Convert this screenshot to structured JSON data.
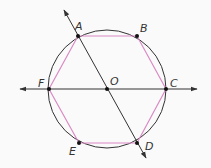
{
  "diagram": {
    "type": "inscribed-regular-hexagon",
    "circle": {
      "center": "O",
      "cx": 107,
      "cy": 89,
      "r": 59,
      "stroke": "#333333"
    },
    "hexagon": {
      "vertices": [
        "A",
        "B",
        "C",
        "D",
        "E",
        "F"
      ],
      "stroke": "#d98ac4"
    },
    "points": [
      {
        "id": "A",
        "label": "A",
        "x": 78,
        "y": 36,
        "lx": 75,
        "ly": 30
      },
      {
        "id": "B",
        "label": "B",
        "x": 137,
        "y": 36,
        "lx": 140,
        "ly": 32
      },
      {
        "id": "C",
        "label": "C",
        "x": 166,
        "y": 89,
        "lx": 170,
        "ly": 87
      },
      {
        "id": "D",
        "label": "D",
        "x": 137,
        "y": 143,
        "lx": 145,
        "ly": 150
      },
      {
        "id": "E",
        "label": "E",
        "x": 79,
        "y": 143,
        "lx": 69,
        "ly": 155
      },
      {
        "id": "F",
        "label": "F",
        "x": 49,
        "y": 89,
        "lx": 38,
        "ly": 87
      },
      {
        "id": "O",
        "label": "O",
        "x": 107,
        "y": 89,
        "lx": 110,
        "ly": 85
      }
    ],
    "lines": [
      {
        "name": "line-FC",
        "through": [
          "F",
          "O",
          "C"
        ],
        "x1": 20,
        "y1": 89,
        "x2": 197,
        "y2": 89
      },
      {
        "name": "line-AD",
        "through": [
          "A",
          "O",
          "D"
        ],
        "x1": 64,
        "y1": 10,
        "x2": 146,
        "y2": 158
      }
    ],
    "line_color": "#333333"
  }
}
